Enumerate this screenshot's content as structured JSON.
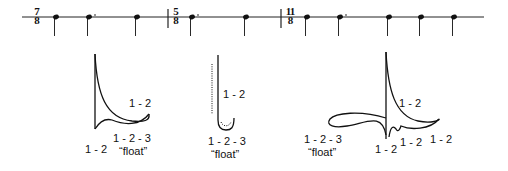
{
  "notation": {
    "measures": [
      {
        "time_signature": {
          "top": "7",
          "bottom": "8"
        },
        "notes": [
          "quarter",
          "dotted-quarter",
          "quarter"
        ]
      },
      {
        "time_signature": {
          "top": "5",
          "bottom": "8"
        },
        "notes": [
          "dotted-quarter",
          "quarter"
        ]
      },
      {
        "time_signature": {
          "top": "11",
          "bottom": "8"
        },
        "notes": [
          "quarter",
          "dotted-quarter",
          "quarter",
          "quarter",
          "quarter"
        ]
      }
    ]
  },
  "gestures": [
    {
      "name": "gesture-7-8",
      "labels": [
        "1 - 2",
        "1 - 2",
        "1 - 2 - 3",
        "“float”"
      ]
    },
    {
      "name": "gesture-5-8",
      "labels": [
        "1 - 2",
        "1 - 2 - 3",
        "“float”"
      ]
    },
    {
      "name": "gesture-11-8",
      "labels": [
        "1 - 2",
        "1 - 2 - 3",
        "“float”",
        "1 - 2",
        "1 - 2",
        "1 - 2"
      ]
    }
  ]
}
